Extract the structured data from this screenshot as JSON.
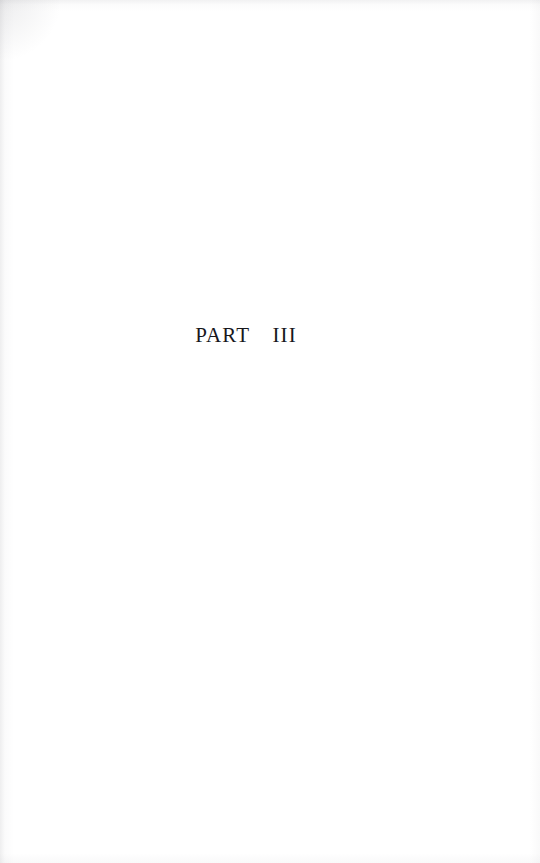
{
  "document": {
    "type": "book-part-title-page",
    "page_background_color": "#ffffff",
    "ink_color": "#17171c"
  },
  "page": {
    "part_title": "PART  III",
    "body_text": "",
    "folio": ""
  },
  "scan": {
    "edge_shadow_color": "#96969b",
    "has_left_edge_shadow": true,
    "has_top_edge_shadow": true,
    "has_right_edge_shadow": true,
    "has_bottom_edge_shadow": true
  }
}
